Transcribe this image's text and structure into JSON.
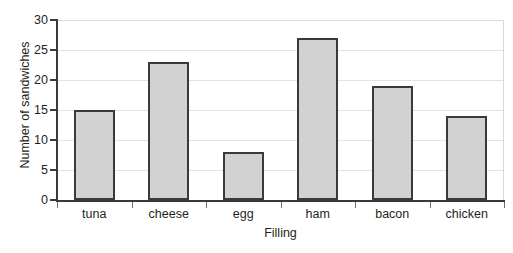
{
  "chart_data": {
    "type": "bar",
    "title": "",
    "xlabel": "Filling",
    "ylabel": "Number of sandwiches",
    "categories": [
      "tuna",
      "cheese",
      "egg",
      "ham",
      "bacon",
      "chicken"
    ],
    "values": [
      15,
      23,
      8,
      27,
      19,
      14
    ],
    "ylim": [
      0,
      30
    ],
    "ytick_step": 5,
    "yticks": [
      0,
      5,
      10,
      15,
      20,
      25,
      30
    ],
    "ytick_labels": [
      "0",
      "5",
      "10",
      "15",
      "20",
      "25",
      "30"
    ],
    "grid": true,
    "grid_axis": "y",
    "legend": false,
    "legend_position": "none",
    "bar_fill_color": "#d2d2d2",
    "bar_edge_color": "#3a3a3a",
    "gridline_color": "#e2e2e2",
    "axis_color": "#3a3a3a",
    "background_color": "#ffffff",
    "text_color": "#231f20"
  }
}
